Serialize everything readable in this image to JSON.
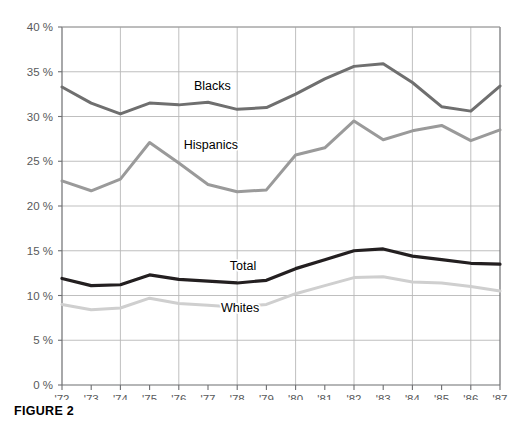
{
  "figure": {
    "caption": "FIGURE 2"
  },
  "chart_data": {
    "type": "line",
    "title": "",
    "xlabel": "",
    "ylabel": "",
    "xlim": [
      1972,
      1987
    ],
    "ylim": [
      0,
      40
    ],
    "ytick_values": [
      0,
      5,
      10,
      15,
      20,
      25,
      30,
      35,
      40
    ],
    "ytick_labels": [
      "0 %",
      "5 %",
      "10 %",
      "15 %",
      "20 %",
      "25 %",
      "30 %",
      "35 %",
      "40 %"
    ],
    "categories": [
      1972,
      1973,
      1974,
      1975,
      1976,
      1977,
      1978,
      1979,
      1980,
      1981,
      1982,
      1983,
      1984,
      1985,
      1986,
      1987
    ],
    "xtick_labels": [
      "'72",
      "'73",
      "'74",
      "'75",
      "'76",
      "'77",
      "'78",
      "'79",
      "'80",
      "'81",
      "'82",
      "'83",
      "'84",
      "'85",
      "'86",
      "'87"
    ],
    "grid": {
      "horizontal": true,
      "vertical": true,
      "vertical_every_years": 2,
      "color": "#b8b8b8"
    },
    "legend_position": "inline-labels",
    "series": [
      {
        "name": "Blacks",
        "color": "#6f6f6f",
        "width": 3.0,
        "label_x": 1977.15,
        "label_y": 33.0,
        "values": [
          33.3,
          31.5,
          30.3,
          31.5,
          31.3,
          31.6,
          30.8,
          31.0,
          32.5,
          34.2,
          35.6,
          35.9,
          33.8,
          31.1,
          30.6,
          33.4
        ]
      },
      {
        "name": "Hispanics",
        "color": "#9a9a9a",
        "width": 3.0,
        "label_x": 1977.1,
        "label_y": 26.4,
        "values": [
          22.8,
          21.7,
          23.0,
          27.1,
          24.8,
          22.4,
          21.6,
          21.8,
          25.7,
          26.5,
          29.5,
          27.4,
          28.4,
          29.0,
          27.3,
          28.5
        ]
      },
      {
        "name": "Total",
        "color": "#231f20",
        "width": 3.2,
        "label_x": 1978.2,
        "label_y": 12.9,
        "values": [
          11.9,
          11.1,
          11.2,
          12.3,
          11.8,
          11.6,
          11.4,
          11.7,
          13.0,
          14.0,
          15.0,
          15.2,
          14.4,
          14.0,
          13.6,
          13.5
        ]
      },
      {
        "name": "Whites",
        "color": "#cfcfcf",
        "width": 3.0,
        "label_x": 1978.1,
        "label_y": 8.2,
        "values": [
          9.0,
          8.4,
          8.6,
          9.7,
          9.1,
          8.9,
          8.7,
          9.0,
          10.2,
          11.1,
          12.0,
          12.1,
          11.5,
          11.4,
          11.0,
          10.5
        ]
      }
    ]
  }
}
